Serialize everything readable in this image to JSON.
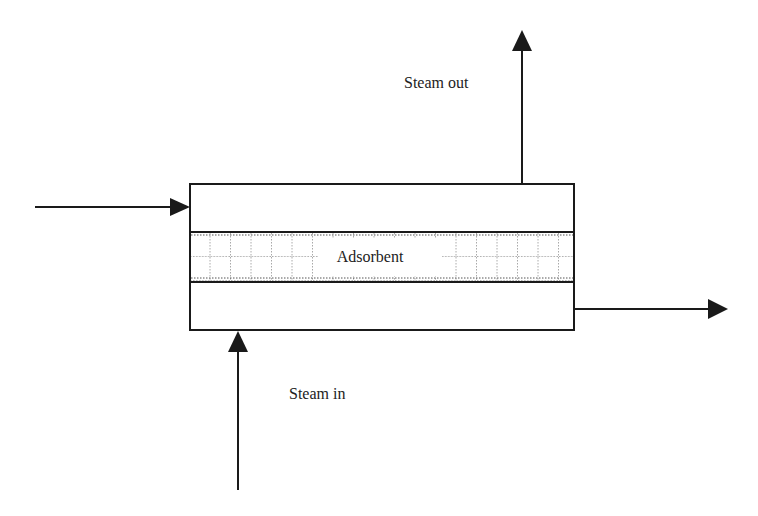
{
  "diagram": {
    "type": "adsorption-bed-schematic",
    "labels": {
      "steam_out": "Steam out",
      "steam_in": "Steam in",
      "adsorbent": "Adsorbent"
    },
    "colors": {
      "line": "#1a1a1a",
      "text": "#222222",
      "grid": "#555555",
      "background": "#ffffff"
    },
    "flows": [
      {
        "id": "feed-in",
        "direction": "right",
        "from": [
          35,
          207
        ],
        "to": [
          190,
          207
        ]
      },
      {
        "id": "product-out",
        "direction": "right",
        "from": [
          574,
          309
        ],
        "to": [
          728,
          309
        ]
      },
      {
        "id": "steam-out",
        "direction": "up",
        "from": [
          522,
          184
        ],
        "to": [
          522,
          30
        ]
      },
      {
        "id": "steam-in",
        "direction": "up",
        "from": [
          238,
          490
        ],
        "to": [
          238,
          331
        ]
      }
    ]
  }
}
